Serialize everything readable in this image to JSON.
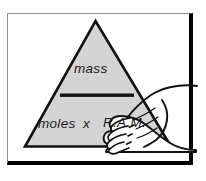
{
  "figure": {
    "kind": "formula-triangle-diagram",
    "background_color": "#ffffff",
    "frame": {
      "fill_color": "#ffffff",
      "highlight_color": "#8e8e8e",
      "shadow_color": "#000000"
    },
    "triangle": {
      "fill_color": "#d4d4d4",
      "stroke_color": "#000000",
      "apex": "top",
      "divider_color": "#000000"
    },
    "hand": {
      "fill_color": "#ffffff",
      "stroke_color": "#000000",
      "description": "hand covering lower-left section",
      "enters_from": "right"
    },
    "labels": {
      "top": "mass",
      "bottom_left": "moles",
      "bottom_operator": "x",
      "bottom_right": "R.A.M."
    }
  }
}
